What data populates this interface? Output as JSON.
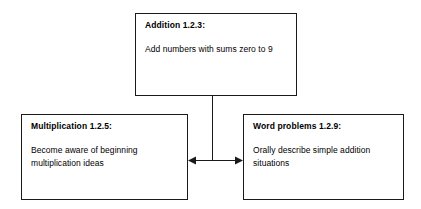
{
  "diagram": {
    "background_color": "#ffffff",
    "line_color": "#1a1a1a",
    "nodes": [
      {
        "id": "addition",
        "title": "Addition 1.2.3:",
        "body": "Add numbers with sums zero to 9"
      },
      {
        "id": "multiplication",
        "title": "Multiplication 1.2.5:",
        "body": "Become aware of beginning multiplication ideas"
      },
      {
        "id": "wordproblems",
        "title": "Word problems 1.2.9:",
        "body": "Orally describe simple addition situations"
      }
    ],
    "connectors": [
      {
        "id": "addition-stem",
        "from": "addition",
        "to": "horizontal-link",
        "style": "plain-line",
        "orientation": "vertical"
      },
      {
        "id": "multiplication-wordproblems-link",
        "from": "multiplication",
        "to": "wordproblems",
        "style": "double-arrow",
        "orientation": "horizontal"
      }
    ]
  }
}
